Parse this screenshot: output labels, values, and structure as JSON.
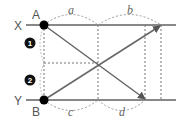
{
  "diagram": {
    "lines": {
      "top": {
        "label": "X",
        "y": 25
      },
      "bottom": {
        "label": "Y",
        "y": 100
      }
    },
    "points": {
      "A": {
        "label": "A",
        "x": 44,
        "y": 25
      },
      "B": {
        "label": "B",
        "x": 44,
        "y": 100
      }
    },
    "segments": {
      "a": "a",
      "b": "b",
      "c": "c",
      "d": "d"
    },
    "markers": [
      {
        "label": "1"
      },
      {
        "label": "2"
      }
    ],
    "colors": {
      "line": "#777777",
      "dash": "#888888",
      "dot": "#000000",
      "text": "#555555"
    }
  }
}
